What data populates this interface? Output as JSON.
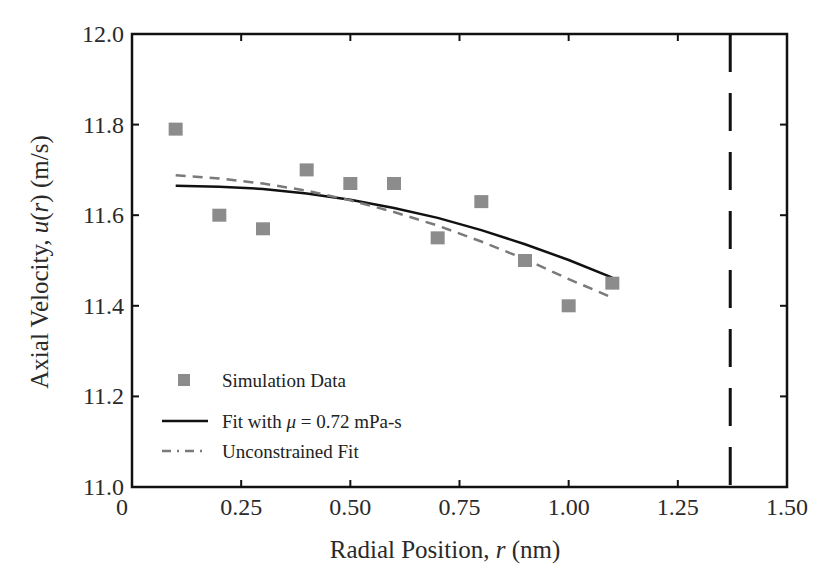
{
  "chart_data": {
    "type": "scatter",
    "title": "",
    "xlabel": "Radial Position, r (nm)",
    "xlabel_parts": {
      "prefix": "Radial Position, ",
      "var": "r",
      "suffix": " (nm)"
    },
    "ylabel": "Axial Velocity, u(r) (m/s)",
    "ylabel_parts": {
      "prefix": "Axial Velocity, ",
      "var": "u",
      "mid": "(",
      "var2": "r",
      "suffix": ") (m/s)"
    },
    "xlim": [
      0,
      1.5
    ],
    "ylim": [
      11.0,
      12.0
    ],
    "x_ticks": [
      0,
      0.25,
      0.5,
      0.75,
      1.0,
      1.25,
      1.5
    ],
    "x_tick_labels": [
      "0",
      "0.25",
      "0.50",
      "0.75",
      "1.00",
      "1.25",
      "1.50"
    ],
    "y_ticks": [
      11.0,
      11.2,
      11.4,
      11.6,
      11.8,
      12.0
    ],
    "y_tick_labels": [
      "11.0",
      "11.2",
      "11.4",
      "11.6",
      "11.8",
      "12.0"
    ],
    "grid": false,
    "legend_position": "lower left",
    "series": [
      {
        "name": "Simulation Data",
        "kind": "scatter",
        "marker": "square",
        "color": "#8c8c8c",
        "x": [
          0.1,
          0.2,
          0.3,
          0.4,
          0.5,
          0.6,
          0.7,
          0.8,
          0.9,
          1.0,
          1.1
        ],
        "y": [
          11.79,
          11.6,
          11.57,
          11.7,
          11.67,
          11.67,
          11.55,
          11.63,
          11.5,
          11.4,
          11.45
        ]
      },
      {
        "name": "Fit with μ = 0.72 mPa-s",
        "kind": "line",
        "style": "solid",
        "color": "#111111",
        "x": [
          0.1,
          0.2,
          0.3,
          0.4,
          0.5,
          0.6,
          0.7,
          0.8,
          0.9,
          1.0,
          1.1
        ],
        "y": [
          11.665,
          11.663,
          11.658,
          11.648,
          11.634,
          11.616,
          11.594,
          11.567,
          11.536,
          11.501,
          11.462
        ]
      },
      {
        "name": "Unconstrained Fit",
        "kind": "line",
        "style": "dashed",
        "color": "#7a7a7a",
        "x": [
          0.1,
          0.2,
          0.3,
          0.4,
          0.5,
          0.6,
          0.7,
          0.8,
          0.9,
          1.0,
          1.1
        ],
        "y": [
          11.688,
          11.681,
          11.67,
          11.654,
          11.633,
          11.607,
          11.577,
          11.542,
          11.503,
          11.459,
          11.418
        ]
      }
    ],
    "annotations": [
      {
        "type": "vertical-line",
        "x": 1.37,
        "style": "long-dash",
        "color": "#111111"
      }
    ]
  },
  "legend": {
    "items": [
      {
        "label": "Simulation Data"
      },
      {
        "label_prefix": "Fit with ",
        "label_mu": "μ",
        "label_suffix": " = 0.72 mPa-s"
      },
      {
        "label": "Unconstrained Fit"
      }
    ]
  }
}
